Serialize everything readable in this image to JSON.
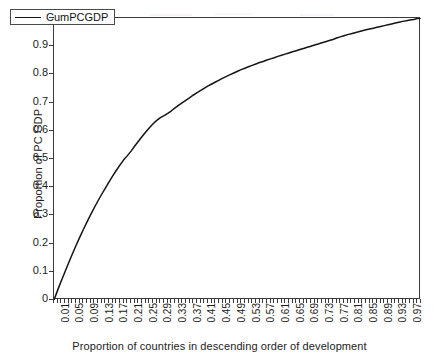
{
  "chart_data": {
    "type": "line",
    "title": "",
    "xlabel": "Proportion of countries in descending order of development",
    "ylabel": "Proportion of PC GDP",
    "xlim": [
      0,
      1
    ],
    "ylim": [
      0,
      1
    ],
    "grid": false,
    "legend_position": "upper-left",
    "line_color": "#141414",
    "frame_color": "#3a3a3a",
    "background_color": "#ffffff",
    "y_ticks": [
      0,
      0.1,
      0.2,
      0.3,
      0.4,
      0.5,
      0.6,
      0.7,
      0.8,
      0.9,
      1
    ],
    "y_tick_labels": [
      "0",
      "0.1",
      "0.2",
      "0.3",
      "0.4",
      "0.5",
      "0.6",
      "0.7",
      "0.8",
      "0.9",
      "1"
    ],
    "x_ticks": [
      0.01,
      0.05,
      0.09,
      0.13,
      0.17,
      0.21,
      0.25,
      0.29,
      0.33,
      0.37,
      0.41,
      0.45,
      0.49,
      0.53,
      0.57,
      0.61,
      0.65,
      0.69,
      0.73,
      0.77,
      0.81,
      0.85,
      0.89,
      0.93,
      0.97
    ],
    "x_tick_labels": [
      "0.01",
      "0.05",
      "0.09",
      "0.13",
      "0.17",
      "0.21",
      "0.25",
      "0.29",
      "0.33",
      "0.37",
      "0.41",
      "0.45",
      "0.49",
      "0.53",
      "0.57",
      "0.61",
      "0.65",
      "0.69",
      "0.73",
      "0.77",
      "0.81",
      "0.85",
      "0.89",
      "0.93",
      "0.97"
    ],
    "series": [
      {
        "name": "CumPCGDP",
        "x": [
          0.0,
          0.01,
          0.02,
          0.03,
          0.04,
          0.05,
          0.06,
          0.07,
          0.08,
          0.09,
          0.1,
          0.11,
          0.12,
          0.13,
          0.14,
          0.15,
          0.16,
          0.17,
          0.18,
          0.19,
          0.2,
          0.21,
          0.22,
          0.23,
          0.24,
          0.25,
          0.26,
          0.27,
          0.28,
          0.29,
          0.3,
          0.31,
          0.32,
          0.33,
          0.34,
          0.35,
          0.36,
          0.37,
          0.38,
          0.39,
          0.4,
          0.41,
          0.42,
          0.43,
          0.44,
          0.45,
          0.46,
          0.47,
          0.48,
          0.49,
          0.5,
          0.51,
          0.52,
          0.53,
          0.54,
          0.55,
          0.56,
          0.57,
          0.58,
          0.59,
          0.6,
          0.61,
          0.62,
          0.63,
          0.64,
          0.65,
          0.66,
          0.67,
          0.68,
          0.69,
          0.7,
          0.71,
          0.72,
          0.73,
          0.74,
          0.75,
          0.76,
          0.77,
          0.78,
          0.79,
          0.8,
          0.81,
          0.82,
          0.83,
          0.84,
          0.85,
          0.86,
          0.87,
          0.88,
          0.89,
          0.9,
          0.91,
          0.92,
          0.93,
          0.94,
          0.95,
          0.96,
          0.97,
          0.98,
          0.99,
          1.0
        ],
        "values": [
          0.0,
          0.035,
          0.068,
          0.1,
          0.132,
          0.163,
          0.193,
          0.222,
          0.25,
          0.277,
          0.303,
          0.328,
          0.352,
          0.375,
          0.397,
          0.419,
          0.44,
          0.46,
          0.479,
          0.497,
          0.512,
          0.528,
          0.546,
          0.563,
          0.58,
          0.596,
          0.611,
          0.625,
          0.637,
          0.647,
          0.654,
          0.662,
          0.671,
          0.681,
          0.691,
          0.7,
          0.709,
          0.718,
          0.727,
          0.735,
          0.743,
          0.751,
          0.759,
          0.766,
          0.773,
          0.78,
          0.787,
          0.793,
          0.799,
          0.805,
          0.811,
          0.817,
          0.822,
          0.827,
          0.832,
          0.837,
          0.842,
          0.846,
          0.851,
          0.855,
          0.859,
          0.864,
          0.868,
          0.872,
          0.876,
          0.88,
          0.884,
          0.888,
          0.892,
          0.896,
          0.9,
          0.904,
          0.908,
          0.912,
          0.916,
          0.92,
          0.924,
          0.929,
          0.933,
          0.937,
          0.941,
          0.944,
          0.948,
          0.951,
          0.955,
          0.958,
          0.961,
          0.964,
          0.967,
          0.97,
          0.973,
          0.976,
          0.979,
          0.982,
          0.985,
          0.988,
          0.99,
          0.993,
          0.995,
          0.998,
          1.0
        ]
      }
    ]
  },
  "legend": {
    "entries": [
      {
        "label": "CumPCGDP",
        "color": "#141414"
      }
    ]
  },
  "axes": {
    "y_title": "Proportion of PC GDP",
    "x_title": "Proportion of countries in descending order of development"
  }
}
